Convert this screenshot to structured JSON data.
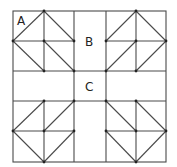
{
  "diagram": {
    "type": "quilt-block-pattern",
    "labels": {
      "a": {
        "text": "A",
        "x": 17,
        "y": 25
      },
      "b": {
        "text": "B",
        "x": 85,
        "y": 46
      },
      "c": {
        "text": "C",
        "x": 85,
        "y": 91
      }
    },
    "colors": {
      "line": "#4a4a4a",
      "dot": "#222222",
      "background": "#ffffff"
    },
    "outer_square": {
      "x1": 13,
      "y1": 11,
      "x2": 166,
      "y2": 162
    },
    "vertical_lines_x": [
      44,
      74,
      106,
      136
    ],
    "horizontal_lines_y": [
      41,
      71,
      101,
      131
    ],
    "corner_blocks": [
      {
        "name": "top-left",
        "diagonals": [
          [
            13,
            41,
            44,
            11
          ],
          [
            44,
            11,
            74,
            41
          ],
          [
            13,
            41,
            44,
            71
          ],
          [
            44,
            41,
            74,
            71
          ]
        ],
        "dots": [
          [
            44,
            11
          ],
          [
            13,
            41
          ],
          [
            44,
            41
          ],
          [
            74,
            41
          ],
          [
            44,
            71
          ],
          [
            74,
            71
          ]
        ]
      },
      {
        "name": "top-right",
        "diagonals": [
          [
            106,
            41,
            136,
            11
          ],
          [
            136,
            11,
            166,
            41
          ],
          [
            106,
            71,
            136,
            41
          ],
          [
            136,
            71,
            166,
            41
          ]
        ],
        "dots": [
          [
            136,
            11
          ],
          [
            106,
            41
          ],
          [
            136,
            41
          ],
          [
            166,
            41
          ],
          [
            106,
            71
          ],
          [
            136,
            71
          ]
        ]
      },
      {
        "name": "bottom-left",
        "diagonals": [
          [
            13,
            131,
            44,
            101
          ],
          [
            44,
            131,
            74,
            101
          ],
          [
            13,
            131,
            44,
            162
          ],
          [
            44,
            162,
            74,
            131
          ]
        ],
        "dots": [
          [
            44,
            101
          ],
          [
            74,
            101
          ],
          [
            13,
            131
          ],
          [
            44,
            131
          ],
          [
            74,
            131
          ],
          [
            44,
            162
          ]
        ]
      },
      {
        "name": "bottom-right",
        "diagonals": [
          [
            106,
            101,
            136,
            131
          ],
          [
            136,
            101,
            166,
            131
          ],
          [
            106,
            131,
            136,
            162
          ],
          [
            136,
            162,
            166,
            131
          ]
        ],
        "dots": [
          [
            106,
            101
          ],
          [
            136,
            101
          ],
          [
            106,
            131
          ],
          [
            136,
            131
          ],
          [
            166,
            131
          ],
          [
            136,
            162
          ]
        ]
      }
    ]
  }
}
